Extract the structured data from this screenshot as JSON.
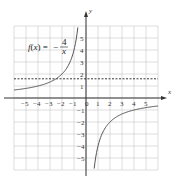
{
  "chart_data": {
    "type": "line",
    "title": "",
    "function_label": {
      "name": "f(x) = ",
      "sign": "−",
      "numerator": "4",
      "denominator": "x"
    },
    "expression": "f(x) = -4/x",
    "xlabel": "x",
    "ylabel": "y",
    "xlim": [
      -6,
      6
    ],
    "ylim": [
      -6,
      6
    ],
    "grid": true,
    "x_ticks": [
      "-5",
      "-4",
      "-3",
      "-2",
      "-1",
      "0",
      "1",
      "2",
      "3",
      "4",
      "5"
    ],
    "y_ticks": [
      "5",
      "4",
      "3",
      "2",
      "1",
      "-1",
      "-2",
      "-3",
      "-4",
      "-5"
    ],
    "series": [
      {
        "name": "f(x) = -4/x (left branch)",
        "x": [
          -6,
          -5,
          -4,
          -3,
          -2,
          -1.5,
          -1,
          -0.8,
          -0.67
        ],
        "y": [
          0.67,
          0.8,
          1,
          1.33,
          2,
          2.67,
          4,
          5,
          6
        ]
      },
      {
        "name": "f(x) = -4/x (right branch)",
        "x": [
          0.67,
          0.8,
          1,
          1.5,
          2,
          3,
          4,
          5,
          6
        ],
        "y": [
          -6,
          -5,
          -4,
          -2.67,
          -2,
          -1.33,
          -1,
          -0.8,
          -0.67
        ]
      }
    ],
    "reference_lines": [
      {
        "orientation": "horizontal",
        "y": 1.6,
        "style": "dashed"
      }
    ],
    "colors": {
      "curve": "#555555",
      "grid": "#c8c8c8",
      "axis": "#333333",
      "dashed": "#222222"
    }
  }
}
